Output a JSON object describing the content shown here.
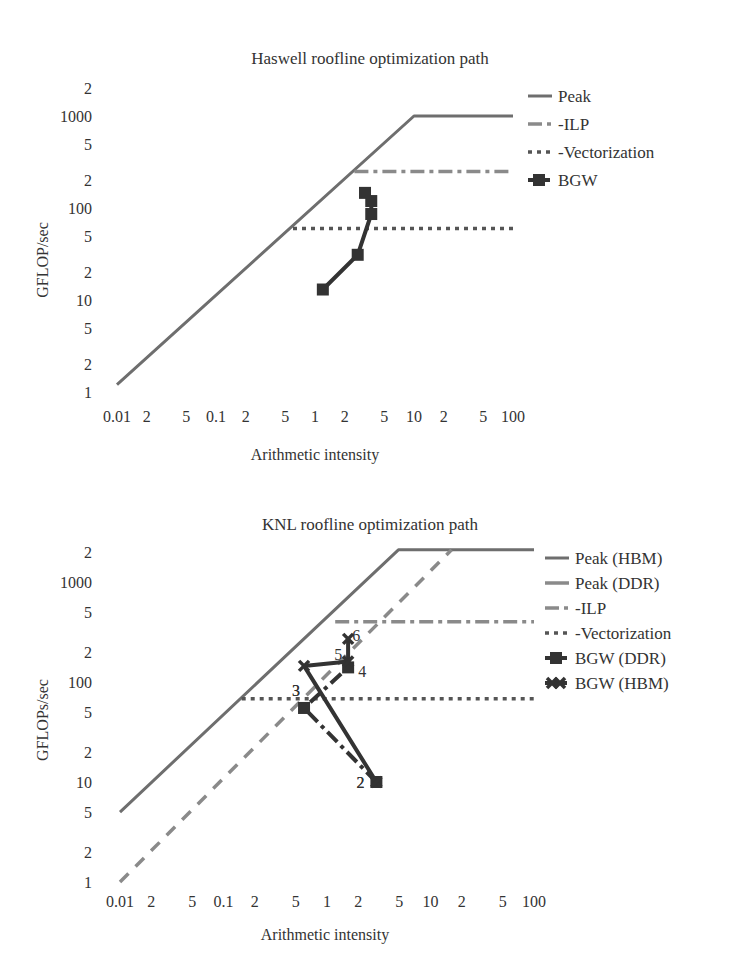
{
  "chart_data": [
    {
      "type": "line",
      "title": "Haswell roofline optimization path",
      "xlabel": "Arithmetic intensity",
      "ylabel": "GFLOP/sec",
      "xscale": "log",
      "yscale": "log",
      "xlim": [
        0.01,
        100
      ],
      "ylim": [
        1,
        2000
      ],
      "x_tick_labels": [
        "0.01",
        "2",
        "5",
        "0.1",
        "2",
        "5",
        "1",
        "2",
        "5",
        "10",
        "2",
        "5",
        "100"
      ],
      "y_tick_labels": [
        "1",
        "2",
        "5",
        "10",
        "2",
        "5",
        "100",
        "2",
        "5",
        "1000",
        "2"
      ],
      "grid": false,
      "legend_position": "right",
      "series": [
        {
          "name": "Peak",
          "style": "solid",
          "x": [
            0.01,
            10,
            100
          ],
          "y": [
            1.2,
            1000,
            1000
          ]
        },
        {
          "name": "-ILP",
          "style": "dash-dot",
          "x": [
            2.5,
            100
          ],
          "y": [
            250,
            250
          ]
        },
        {
          "name": "-Vectorization",
          "style": "dotted",
          "x": [
            0.6,
            100
          ],
          "y": [
            60,
            60
          ]
        },
        {
          "name": "BGW",
          "style": "solid-square-markers",
          "x": [
            1.2,
            2.7,
            3.7,
            3.7,
            3.2
          ],
          "y": [
            13,
            31,
            86,
            119,
            146
          ]
        }
      ]
    },
    {
      "type": "line",
      "title": "KNL roofline optimization path",
      "xlabel": "Arithmetic intensity",
      "ylabel": "GFLOPs/sec",
      "xscale": "log",
      "yscale": "log",
      "xlim": [
        0.01,
        100
      ],
      "ylim": [
        1,
        2000
      ],
      "x_tick_labels": [
        "0.01",
        "2",
        "5",
        "0.1",
        "2",
        "5",
        "1",
        "2",
        "5",
        "10",
        "2",
        "5",
        "100"
      ],
      "y_tick_labels": [
        "1",
        "2",
        "5",
        "10",
        "2",
        "5",
        "100",
        "2",
        "5",
        "1000",
        "2"
      ],
      "grid": false,
      "legend_position": "right",
      "series": [
        {
          "name": "Peak (HBM)",
          "style": "solid",
          "x": [
            0.01,
            4.9,
            100
          ],
          "y": [
            5,
            2100,
            2100
          ]
        },
        {
          "name": "Peak (DDR)",
          "style": "dashed",
          "x": [
            0.01,
            16
          ],
          "y": [
            1,
            2100
          ]
        },
        {
          "name": "-ILP",
          "style": "dash-dot",
          "x": [
            1.2,
            100
          ],
          "y": [
            400,
            400
          ]
        },
        {
          "name": "-Vectorization",
          "style": "dotted",
          "x": [
            0.15,
            100
          ],
          "y": [
            68,
            68
          ]
        },
        {
          "name": "BGW (DDR)",
          "style": "dash-dot-square-markers",
          "x": [
            3.0,
            0.6,
            1.6
          ],
          "y": [
            10,
            55,
            140
          ],
          "point_labels": [
            "2",
            "3",
            "4"
          ]
        },
        {
          "name": "BGW (HBM)",
          "style": "solid-x-markers",
          "x": [
            3.0,
            0.6,
            1.6,
            1.6
          ],
          "y": [
            10,
            145,
            160,
            270
          ],
          "point_labels": [
            "2",
            "",
            "5",
            "6"
          ]
        }
      ],
      "annotations": [
        "2",
        "3",
        "4",
        "5",
        "6"
      ]
    }
  ],
  "colors": {
    "peak": "#6e6e6e",
    "peak_ddr": "#8a8a8a",
    "ilp": "#8a8a8a",
    "vectorization": "#555555",
    "bgw": "#333333",
    "text": "#333333"
  }
}
